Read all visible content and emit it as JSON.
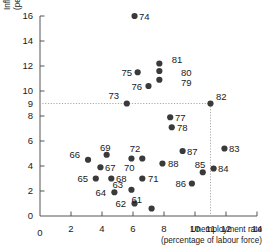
{
  "chart_data": {
    "type": "scatter",
    "title": "",
    "xlabel": "Unemployment rate (percentage of labour force)",
    "xlabel_line1": "Unemployment rate",
    "xlabel_line2": "(percentage of labour force)",
    "ylabel": "Inflation rate (percent per year)",
    "ylabel_line1": "Inflation rate",
    "ylabel_line2": "(percent per year)",
    "xlim": [
      0,
      14
    ],
    "ylim": [
      0,
      16
    ],
    "xticks": [
      0,
      2,
      4,
      6,
      8,
      10,
      11,
      12,
      14
    ],
    "xticklabels": [
      "0",
      "2",
      "4",
      "6",
      "8",
      "10",
      "11",
      "12",
      "14"
    ],
    "yticks": [
      0,
      2,
      4,
      6,
      8,
      9,
      10,
      12,
      14,
      16
    ],
    "yticklabels": [
      "0",
      "2",
      "4",
      "6",
      "8",
      "9",
      "10",
      "12",
      "14",
      "16"
    ],
    "grid": false,
    "legend": "none",
    "guides": {
      "vertical_x": 11,
      "horizontal_y": 9,
      "style": "dotted",
      "color": "#aaaaaa"
    },
    "marker_color": "#3a3a3a",
    "marker_size": 3.1,
    "points": [
      {
        "label": "61",
        "x": 7.2,
        "y": 0.6,
        "lx": 142,
        "ly": 203,
        "anchor": "end"
      },
      {
        "label": "62",
        "x": 6.1,
        "y": 1.0,
        "lx": 126,
        "ly": 207,
        "anchor": "end"
      },
      {
        "label": "63",
        "x": 5.9,
        "y": 2.1,
        "lx": 123,
        "ly": 188,
        "anchor": "end"
      },
      {
        "label": "64",
        "x": 4.8,
        "y": 1.9,
        "lx": 106,
        "ly": 196,
        "anchor": "end"
      },
      {
        "label": "65",
        "x": 3.6,
        "y": 3.0,
        "lx": 88,
        "ly": 182,
        "anchor": "end"
      },
      {
        "label": "66",
        "x": 3.1,
        "y": 4.5,
        "lx": 80,
        "ly": 158,
        "anchor": "end"
      },
      {
        "label": "67",
        "x": 3.9,
        "y": 3.9,
        "lx": 105,
        "ly": 171,
        "anchor": "start"
      },
      {
        "label": "68",
        "x": 4.6,
        "y": 3.0,
        "lx": 116,
        "ly": 182,
        "anchor": "start"
      },
      {
        "label": "69",
        "x": 4.3,
        "y": 4.9,
        "lx": 100,
        "ly": 151,
        "anchor": "start"
      },
      {
        "label": "70",
        "x": 5.9,
        "y": 4.6,
        "lx": 124,
        "ly": 171,
        "anchor": "start"
      },
      {
        "label": "71",
        "x": 6.6,
        "y": 3.0,
        "lx": 148,
        "ly": 182,
        "anchor": "start"
      },
      {
        "label": "72",
        "x": 6.6,
        "y": 4.6,
        "lx": 135,
        "ly": 152,
        "anchor": "middle"
      },
      {
        "label": "73",
        "x": 5.6,
        "y": 9.0,
        "lx": 119,
        "ly": 99,
        "anchor": "end"
      },
      {
        "label": "74",
        "x": 6.1,
        "y": 16.0,
        "lx": 139,
        "ly": 20,
        "anchor": "start"
      },
      {
        "label": "75",
        "x": 6.3,
        "y": 11.5,
        "lx": 132,
        "ly": 76,
        "anchor": "end"
      },
      {
        "label": "76",
        "x": 7.0,
        "y": 10.4,
        "lx": 142,
        "ly": 90,
        "anchor": "end"
      },
      {
        "label": "77",
        "x": 8.4,
        "y": 7.9,
        "lx": 175,
        "ly": 121,
        "anchor": "start"
      },
      {
        "label": "78",
        "x": 8.5,
        "y": 7.1,
        "lx": 177,
        "ly": 131,
        "anchor": "start"
      },
      {
        "label": "79",
        "x": 7.7,
        "y": 10.9,
        "lx": 181,
        "ly": 86,
        "anchor": "start"
      },
      {
        "label": "80",
        "x": 7.7,
        "y": 11.6,
        "lx": 181,
        "ly": 76,
        "anchor": "start"
      },
      {
        "label": "81",
        "x": 7.7,
        "y": 12.2,
        "lx": 177,
        "ly": 63,
        "anchor": "middle"
      },
      {
        "label": "82",
        "x": 11.0,
        "y": 9.0,
        "lx": 216,
        "ly": 100,
        "anchor": "start"
      },
      {
        "label": "83",
        "x": 11.9,
        "y": 5.4,
        "lx": 229,
        "ly": 152,
        "anchor": "start"
      },
      {
        "label": "84",
        "x": 11.2,
        "y": 3.8,
        "lx": 218,
        "ly": 172,
        "anchor": "start"
      },
      {
        "label": "85",
        "x": 10.5,
        "y": 3.5,
        "lx": 200,
        "ly": 168,
        "anchor": "middle"
      },
      {
        "label": "86",
        "x": 9.8,
        "y": 2.6,
        "lx": 186,
        "ly": 187,
        "anchor": "end"
      },
      {
        "label": "87",
        "x": 9.2,
        "y": 5.2,
        "lx": 187,
        "ly": 155,
        "anchor": "start"
      },
      {
        "label": "88",
        "x": 7.9,
        "y": 4.2,
        "lx": 168,
        "ly": 167,
        "anchor": "start"
      }
    ]
  }
}
